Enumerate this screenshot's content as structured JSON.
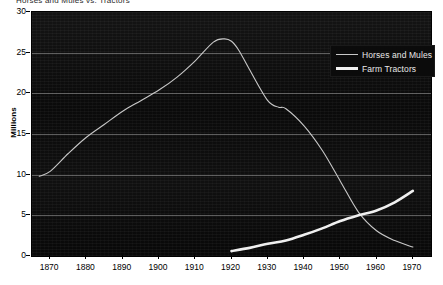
{
  "chart_data": {
    "type": "line",
    "title": "Horses and Mules vs. Tractors",
    "xlabel": "",
    "ylabel": "Millions",
    "xlim": [
      1865,
      1975
    ],
    "ylim": [
      0,
      30
    ],
    "xticks": [
      1870,
      1880,
      1890,
      1900,
      1910,
      1920,
      1930,
      1940,
      1950,
      1960,
      1970
    ],
    "yticks": [
      0,
      5,
      10,
      15,
      20,
      25,
      30
    ],
    "grid": true,
    "legend_position": "top-right",
    "series": [
      {
        "name": "Horses and Mules",
        "style": "thin",
        "color": "#c8c8c8",
        "x": [
          1867,
          1870,
          1875,
          1880,
          1885,
          1890,
          1895,
          1900,
          1905,
          1910,
          1915,
          1918,
          1920,
          1922,
          1925,
          1930,
          1933,
          1935,
          1940,
          1945,
          1950,
          1955,
          1960,
          1965,
          1970
        ],
        "y": [
          9.8,
          10.4,
          12.6,
          14.6,
          16.2,
          17.8,
          19.1,
          20.4,
          22.0,
          24.0,
          26.3,
          26.7,
          26.4,
          25.3,
          22.9,
          19.1,
          18.3,
          18.1,
          16.0,
          13.0,
          9.2,
          5.4,
          3.1,
          1.9,
          1.1
        ]
      },
      {
        "name": "Farm Tractors",
        "style": "thick",
        "color": "#f0f0f0",
        "x": [
          1920,
          1925,
          1930,
          1935,
          1940,
          1945,
          1950,
          1955,
          1960,
          1965,
          1970
        ],
        "y": [
          0.6,
          1.0,
          1.5,
          1.9,
          2.6,
          3.4,
          4.3,
          5.0,
          5.6,
          6.6,
          8.0
        ]
      }
    ]
  },
  "legend": {
    "items": [
      {
        "label": "Horses and Mules"
      },
      {
        "label": "Farm Tractors"
      }
    ]
  },
  "axes": {
    "y_label": "Millions",
    "y_ticks": [
      "30",
      "25",
      "20",
      "15",
      "10",
      "5",
      "0"
    ],
    "x_ticks": [
      "1870",
      "1880",
      "1890",
      "1900",
      "1910",
      "1920",
      "1930",
      "1940",
      "1950",
      "1960",
      "1970"
    ]
  },
  "title_strip": "Horses and Mules vs. Tractors"
}
